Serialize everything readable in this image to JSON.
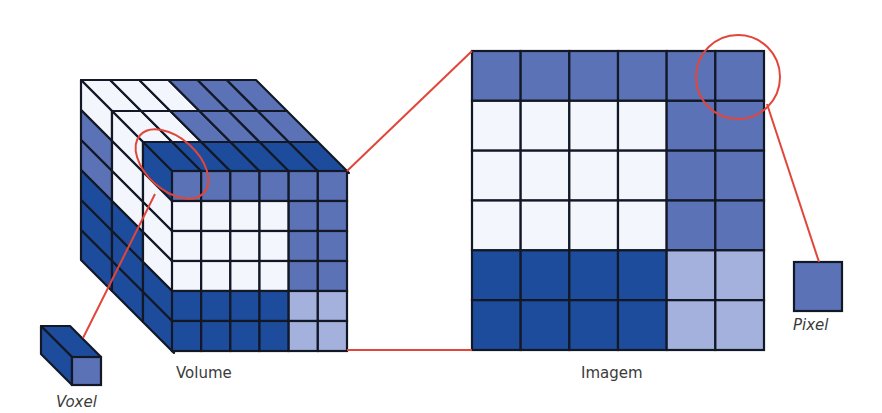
{
  "labels": {
    "volume": "Volume",
    "image": "Imagem",
    "voxel": "Voxel",
    "pixel": "Pixel"
  },
  "colors": {
    "white": "#f3f6fc",
    "medium": "#5b73b6",
    "dark": "#1e4c9c",
    "light": "#a4b1dc",
    "outline": "#121826",
    "highlight": "#e2453a"
  },
  "image_grid": [
    [
      "M",
      "M",
      "M",
      "M",
      "M",
      "M"
    ],
    [
      "W",
      "W",
      "W",
      "W",
      "M",
      "M"
    ],
    [
      "W",
      "W",
      "W",
      "W",
      "M",
      "M"
    ],
    [
      "W",
      "W",
      "W",
      "W",
      "M",
      "M"
    ],
    [
      "D",
      "D",
      "D",
      "D",
      "L",
      "L"
    ],
    [
      "D",
      "D",
      "D",
      "D",
      "L",
      "L"
    ]
  ],
  "volume": {
    "front_face": [
      [
        "M",
        "M",
        "M",
        "M",
        "M",
        "M"
      ],
      [
        "W",
        "W",
        "W",
        "W",
        "M",
        "M"
      ],
      [
        "W",
        "W",
        "W",
        "W",
        "M",
        "M"
      ],
      [
        "W",
        "W",
        "W",
        "W",
        "M",
        "M"
      ],
      [
        "D",
        "D",
        "D",
        "D",
        "L",
        "L"
      ],
      [
        "D",
        "D",
        "D",
        "D",
        "L",
        "L"
      ]
    ],
    "top_rows": [
      [
        "W",
        "W",
        "W",
        "M",
        "M",
        "M"
      ],
      [
        "W",
        "W",
        "M",
        "M",
        "M",
        "M"
      ],
      [
        "D",
        "D",
        "D",
        "D",
        "D",
        "D"
      ]
    ],
    "side_columns": [
      [
        "W",
        "M",
        "M",
        "D",
        "D",
        "D"
      ],
      [
        "W",
        "W",
        "W",
        "D",
        "D",
        "D"
      ],
      [
        "D",
        "W",
        "W",
        "W",
        "D",
        "D"
      ]
    ]
  }
}
